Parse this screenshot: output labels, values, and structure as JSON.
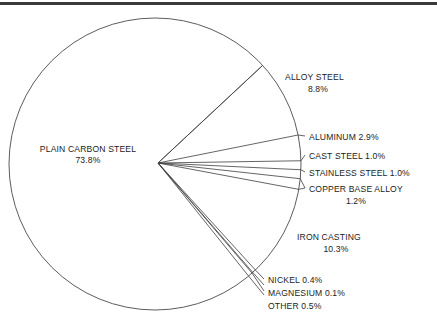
{
  "chart_data": {
    "type": "pie",
    "title": "",
    "subtitle": "",
    "xlabel": "",
    "ylabel": "",
    "legend_position": "none",
    "grid": false,
    "units": "percent",
    "total": 100.0,
    "categories": [
      "ALLOY STEEL",
      "ALUMINUM",
      "CAST STEEL",
      "STAINLESS STEEL",
      "COPPER BASE ALLOY",
      "IRON CASTING",
      "NICKEL",
      "MAGNESIUM",
      "OTHER",
      "PLAIN CARBON STEEL"
    ],
    "values": [
      8.8,
      2.9,
      1.0,
      1.0,
      1.2,
      10.3,
      0.4,
      0.1,
      0.5,
      73.8
    ],
    "slices": [
      {
        "name": "ALLOY STEEL",
        "value": 8.8,
        "label_name": "ALLOY STEEL",
        "label_value": "8.8%",
        "label_lines": [
          "ALLOY STEEL",
          "8.8%"
        ],
        "label_align": "center",
        "start_angle_deg": -43.0,
        "end_angle_deg": -11.3
      },
      {
        "name": "ALUMINUM",
        "value": 2.9,
        "label_name": "ALUMINUM",
        "label_value": "2.9%",
        "label_lines": [
          "ALUMINUM 2.9%"
        ],
        "label_align": "start",
        "start_angle_deg": -11.3,
        "end_angle_deg": -0.9
      },
      {
        "name": "CAST STEEL",
        "value": 1.0,
        "label_name": "CAST STEEL",
        "label_value": "1.0%",
        "label_lines": [
          "CAST STEEL 1.0%"
        ],
        "label_align": "start",
        "start_angle_deg": -0.9,
        "end_angle_deg": 2.7
      },
      {
        "name": "STAINLESS STEEL",
        "value": 1.0,
        "label_name": "STAINLESS STEEL",
        "label_value": "1.0%",
        "label_lines": [
          "STAINLESS STEEL 1.0%"
        ],
        "label_align": "start",
        "start_angle_deg": 2.7,
        "end_angle_deg": 6.3
      },
      {
        "name": "COPPER BASE ALLOY",
        "value": 1.2,
        "label_name": "COPPER BASE ALLOY",
        "label_value": "1.2%",
        "label_lines": [
          "COPPER BASE ALLOY",
          "1.2%"
        ],
        "label_align": "center",
        "start_angle_deg": 6.3,
        "end_angle_deg": 10.6
      },
      {
        "name": "IRON CASTING",
        "value": 10.3,
        "label_name": "IRON CASTING",
        "label_value": "10.3%",
        "label_lines": [
          "IRON CASTING",
          "10.3%"
        ],
        "label_align": "center",
        "start_angle_deg": 10.6,
        "end_angle_deg": 47.7
      },
      {
        "name": "NICKEL",
        "value": 0.4,
        "label_name": "NICKEL",
        "label_value": "0.4%",
        "label_lines": [
          "NICKEL 0.4%"
        ],
        "label_align": "start",
        "start_angle_deg": 47.7,
        "end_angle_deg": 49.1
      },
      {
        "name": "MAGNESIUM",
        "value": 0.1,
        "label_name": "MAGNESIUM",
        "label_value": "0.1%",
        "label_lines": [
          "MAGNESIUM 0.1%"
        ],
        "label_align": "start",
        "start_angle_deg": 49.1,
        "end_angle_deg": 49.5
      },
      {
        "name": "OTHER",
        "value": 0.5,
        "label_name": "OTHER",
        "label_value": "0.5%",
        "label_lines": [
          "OTHER 0.5%"
        ],
        "label_align": "start",
        "start_angle_deg": 49.5,
        "end_angle_deg": 51.3
      },
      {
        "name": "PLAIN CARBON STEEL",
        "value": 73.8,
        "label_name": "PLAIN CARBON STEEL",
        "label_value": "73.8%",
        "label_lines": [
          "PLAIN CARBON STEEL",
          "73.8%"
        ],
        "label_align": "center",
        "start_angle_deg": 51.3,
        "end_angle_deg": 317.0
      }
    ]
  },
  "labels": {
    "plain_carbon_steel_name": "PLAIN CARBON STEEL",
    "plain_carbon_steel_value": "73.8%",
    "alloy_steel_name": "ALLOY STEEL",
    "alloy_steel_value": "8.8%",
    "aluminum": "ALUMINUM 2.9%",
    "cast_steel": "CAST STEEL 1.0%",
    "stainless_steel": "STAINLESS STEEL 1.0%",
    "copper_base_alloy_name": "COPPER BASE ALLOY",
    "copper_base_alloy_value": "1.2%",
    "iron_casting_name": "IRON CASTING",
    "iron_casting_value": "10.3%",
    "nickel": "NICKEL 0.4%",
    "magnesium": "MAGNESIUM 0.1%",
    "other": "OTHER 0.5%"
  },
  "colors": {
    "outline": "#4a4a4a",
    "slice_edge": "#3d3d3d",
    "text": "#1c1c1c",
    "rule": "#3a3a3a",
    "background": "#ffffff"
  }
}
